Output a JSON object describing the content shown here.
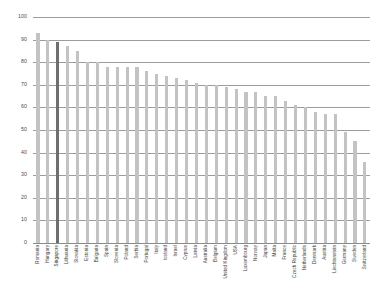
{
  "chart_data": {
    "type": "bar",
    "title": "",
    "subtitle": "",
    "xlabel": "",
    "ylabel": "",
    "ylim": [
      0,
      100
    ],
    "yticks": [
      0,
      10,
      20,
      30,
      40,
      50,
      60,
      70,
      80,
      90,
      100
    ],
    "grid": true,
    "legend": false,
    "legend_position": "none",
    "bar_color": "#c3c3c3",
    "highlight_color": "#6e6e6e",
    "highlight_category": "Singapore",
    "categories": [
      "Romania",
      "Hungary",
      "Singapore",
      "Lithuania",
      "Slovakia",
      "Estonia",
      "Bulgaria",
      "Spain",
      "Slovenia",
      "Poland",
      "Serbia",
      "Portugal",
      "Italy",
      "Iceland",
      "Israel",
      "Cyprus",
      "Latvia",
      "Australia",
      "Belgium",
      "United Kingdom",
      "USA",
      "Luxembourg",
      "Norway",
      "Japan",
      "Malta",
      "France",
      "Czech Republic",
      "Netherlands",
      "Denmark",
      "Austria",
      "Liechtenstein",
      "Germany",
      "Sweden",
      "Switzerland"
    ],
    "values": [
      93,
      90,
      89,
      87,
      85,
      80,
      80,
      78,
      78,
      78,
      78,
      76,
      75,
      74,
      73,
      72,
      71,
      70,
      70,
      69,
      68,
      67,
      67,
      65,
      65,
      63,
      61,
      60,
      58,
      57,
      57,
      49,
      45,
      36
    ]
  },
  "axis": {
    "y_tick_labels": [
      "100",
      "90",
      "80",
      "70",
      "60",
      "50",
      "40",
      "30",
      "20",
      "10",
      "0"
    ]
  }
}
